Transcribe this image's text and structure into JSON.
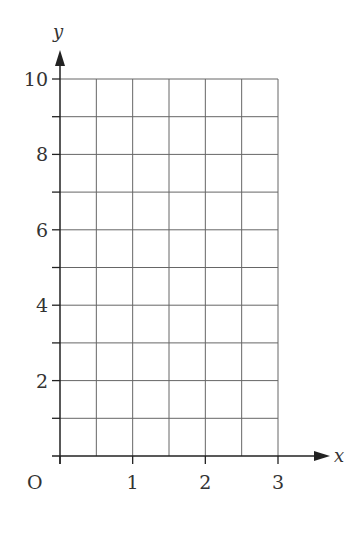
{
  "chart_data": {
    "type": "line",
    "title": "",
    "xlabel": "x",
    "ylabel": "y",
    "origin_label": "O",
    "xlim": [
      0,
      3
    ],
    "ylim": [
      0,
      10
    ],
    "x_ticks": [
      "1",
      "2",
      "3"
    ],
    "y_ticks": [
      "2",
      "4",
      "6",
      "8",
      "10"
    ],
    "grid": true,
    "grid_x_step": 0.5,
    "grid_y_step": 1,
    "series": []
  },
  "colors": {
    "grid": "#555555",
    "axis": "#222222",
    "text": "#333333"
  }
}
